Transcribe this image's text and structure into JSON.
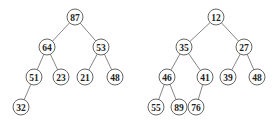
{
  "trees": [
    {
      "name": "max-heap",
      "nodes": [
        {
          "id": "a0",
          "label": "87",
          "x": 75,
          "y": 17
        },
        {
          "id": "a1",
          "label": "64",
          "x": 47,
          "y": 47
        },
        {
          "id": "a2",
          "label": "53",
          "x": 101,
          "y": 47
        },
        {
          "id": "a3",
          "label": "51",
          "x": 34,
          "y": 77
        },
        {
          "id": "a4",
          "label": "23",
          "x": 61,
          "y": 77
        },
        {
          "id": "a5",
          "label": "21",
          "x": 85,
          "y": 77
        },
        {
          "id": "a6",
          "label": "48",
          "x": 115,
          "y": 77
        },
        {
          "id": "a7",
          "label": "32",
          "x": 21,
          "y": 107
        }
      ],
      "edges": [
        [
          "a0",
          "a1"
        ],
        [
          "a0",
          "a2"
        ],
        [
          "a1",
          "a3"
        ],
        [
          "a1",
          "a4"
        ],
        [
          "a2",
          "a5"
        ],
        [
          "a2",
          "a6"
        ],
        [
          "a3",
          "a7"
        ]
      ]
    },
    {
      "name": "min-heap",
      "nodes": [
        {
          "id": "b0",
          "label": "12",
          "x": 216,
          "y": 17
        },
        {
          "id": "b1",
          "label": "35",
          "x": 184,
          "y": 47
        },
        {
          "id": "b2",
          "label": "27",
          "x": 244,
          "y": 47
        },
        {
          "id": "b3",
          "label": "46",
          "x": 167,
          "y": 77
        },
        {
          "id": "b4",
          "label": "41",
          "x": 205,
          "y": 77
        },
        {
          "id": "b5",
          "label": "39",
          "x": 228,
          "y": 77
        },
        {
          "id": "b6",
          "label": "48",
          "x": 257,
          "y": 77
        },
        {
          "id": "b7",
          "label": "55",
          "x": 156,
          "y": 107
        },
        {
          "id": "b8",
          "label": "89",
          "x": 179,
          "y": 107
        },
        {
          "id": "b9",
          "label": "76",
          "x": 196,
          "y": 107
        }
      ],
      "edges": [
        [
          "b0",
          "b1"
        ],
        [
          "b0",
          "b2"
        ],
        [
          "b1",
          "b3"
        ],
        [
          "b1",
          "b4"
        ],
        [
          "b2",
          "b5"
        ],
        [
          "b2",
          "b6"
        ],
        [
          "b3",
          "b7"
        ],
        [
          "b3",
          "b8"
        ],
        [
          "b4",
          "b9"
        ]
      ]
    }
  ],
  "style": {
    "node_radius": 8
  }
}
